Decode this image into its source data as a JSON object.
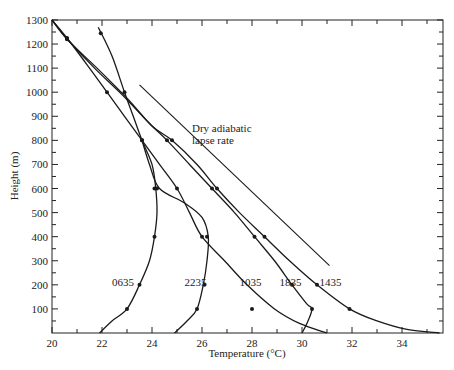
{
  "chart_data": {
    "type": "line",
    "title": "",
    "xlabel": "Temperature (°C)",
    "ylabel": "Height (m)",
    "xlim": [
      20,
      35.6
    ],
    "ylim": [
      0,
      1300
    ],
    "x_ticks": [
      20,
      22,
      24,
      26,
      28,
      30,
      32,
      34
    ],
    "x_tick_labels": [
      "20",
      "22",
      "24",
      "26",
      "28",
      "30",
      "32",
      "34"
    ],
    "y_ticks": [
      100,
      200,
      300,
      400,
      500,
      600,
      700,
      800,
      900,
      1000,
      1100,
      1200,
      1300
    ],
    "y_tick_labels": [
      "100",
      "200",
      "300",
      "400",
      "500",
      "600",
      "700",
      "800",
      "900",
      "1000",
      "1100",
      "1200",
      "1300"
    ],
    "grid": false,
    "legend": "none (curves labelled inline)",
    "series": [
      {
        "name": "0635",
        "label_pos": [
          22.4,
          210
        ],
        "points": [
          [
            21.9,
            0
          ],
          [
            22.4,
            50
          ],
          [
            23.0,
            100
          ],
          [
            23.5,
            200
          ],
          [
            23.9,
            300
          ],
          [
            24.1,
            400
          ],
          [
            24.2,
            500
          ],
          [
            24.15,
            600
          ],
          [
            24.0,
            700
          ],
          [
            23.6,
            800
          ],
          [
            23.25,
            900
          ],
          [
            22.9,
            1000
          ],
          [
            22.4,
            1150
          ],
          [
            21.85,
            1270
          ]
        ],
        "markers": [
          [
            23.0,
            100
          ],
          [
            23.5,
            200
          ],
          [
            24.1,
            400
          ],
          [
            24.1,
            600
          ],
          [
            23.6,
            800
          ],
          [
            22.9,
            1000
          ],
          [
            21.95,
            1245
          ]
        ]
      },
      {
        "name": "2235",
        "label_pos": [
          25.3,
          210
        ],
        "points": [
          [
            24.9,
            0
          ],
          [
            25.4,
            50
          ],
          [
            25.8,
            100
          ],
          [
            26.05,
            200
          ],
          [
            26.2,
            300
          ],
          [
            26.25,
            400
          ],
          [
            26.0,
            480
          ],
          [
            25.3,
            540
          ],
          [
            24.3,
            600
          ],
          [
            23.9,
            700
          ],
          [
            23.6,
            800
          ]
        ],
        "markers": [
          [
            25.8,
            100
          ],
          [
            26.1,
            200
          ],
          [
            26.2,
            400
          ],
          [
            24.2,
            600
          ]
        ]
      },
      {
        "name": "1035",
        "label_pos": [
          27.5,
          210
        ],
        "points": [
          [
            20.0,
            1300
          ],
          [
            20.6,
            1225
          ],
          [
            21.5,
            1100
          ],
          [
            22.2,
            1000
          ],
          [
            22.9,
            900
          ],
          [
            23.6,
            800
          ],
          [
            24.3,
            700
          ],
          [
            25.0,
            600
          ],
          [
            25.5,
            500
          ],
          [
            26.0,
            400
          ],
          [
            26.9,
            300
          ],
          [
            27.8,
            200
          ],
          [
            28.9,
            100
          ],
          [
            29.9,
            40
          ],
          [
            31.0,
            0
          ]
        ],
        "markers": [
          [
            20.6,
            1225
          ],
          [
            22.2,
            1000
          ],
          [
            23.6,
            800
          ],
          [
            25.0,
            600
          ],
          [
            26.0,
            400
          ],
          [
            28.0,
            100
          ]
        ]
      },
      {
        "name": "1835",
        "label_pos": [
          29.1,
          210
        ],
        "points": [
          [
            20.0,
            1300
          ],
          [
            20.6,
            1222
          ],
          [
            21.7,
            1100
          ],
          [
            22.8,
            990
          ],
          [
            23.9,
            870
          ],
          [
            24.6,
            800
          ],
          [
            25.5,
            700
          ],
          [
            26.4,
            600
          ],
          [
            27.3,
            500
          ],
          [
            28.1,
            400
          ],
          [
            28.9,
            300
          ],
          [
            29.6,
            200
          ],
          [
            30.2,
            120
          ],
          [
            30.4,
            100
          ],
          [
            30.2,
            40
          ],
          [
            30.0,
            0
          ]
        ],
        "markers": [
          [
            20.6,
            1222
          ],
          [
            24.6,
            800
          ],
          [
            26.4,
            600
          ],
          [
            28.1,
            400
          ],
          [
            29.6,
            200
          ],
          [
            30.4,
            100
          ]
        ]
      },
      {
        "name": "1435",
        "label_pos": [
          30.7,
          210
        ],
        "points": [
          [
            20.0,
            1300
          ],
          [
            20.6,
            1220
          ],
          [
            21.8,
            1100
          ],
          [
            23.0,
            975
          ],
          [
            24.0,
            860
          ],
          [
            24.8,
            800
          ],
          [
            25.8,
            700
          ],
          [
            26.6,
            600
          ],
          [
            27.5,
            500
          ],
          [
            28.5,
            400
          ],
          [
            29.5,
            300
          ],
          [
            30.6,
            200
          ],
          [
            31.9,
            100
          ],
          [
            33.0,
            50
          ],
          [
            34.2,
            15
          ],
          [
            35.5,
            0
          ]
        ],
        "markers": [
          [
            20.6,
            1220
          ],
          [
            24.8,
            800
          ],
          [
            26.6,
            600
          ],
          [
            28.5,
            400
          ],
          [
            30.6,
            200
          ],
          [
            31.9,
            100
          ]
        ]
      }
    ],
    "reference_lines": [
      {
        "name": "Dry adiabatic lapse rate",
        "points": [
          [
            23.5,
            1030
          ],
          [
            31.1,
            280
          ]
        ]
      }
    ],
    "annotations": [
      {
        "text_lines": [
          "Dry adiabatic",
          "lapse rate"
        ],
        "pos": [
          25.6,
          835
        ]
      }
    ]
  }
}
